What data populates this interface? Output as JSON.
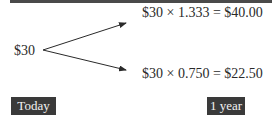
{
  "diagram": {
    "start_value": "$30",
    "outcomes": [
      {
        "formula": "$30 × 1.333 = $40.00",
        "direction": "up"
      },
      {
        "formula": "$30 × 0.750 = $22.50",
        "direction": "down"
      }
    ],
    "timeline": {
      "start_label": "Today",
      "end_label": "1 year"
    },
    "colors": {
      "badge_bg": "#3a3a3a",
      "badge_text": "#f2f2f2",
      "rule": "#4a4a4a",
      "text": "#2a2a2a"
    }
  }
}
